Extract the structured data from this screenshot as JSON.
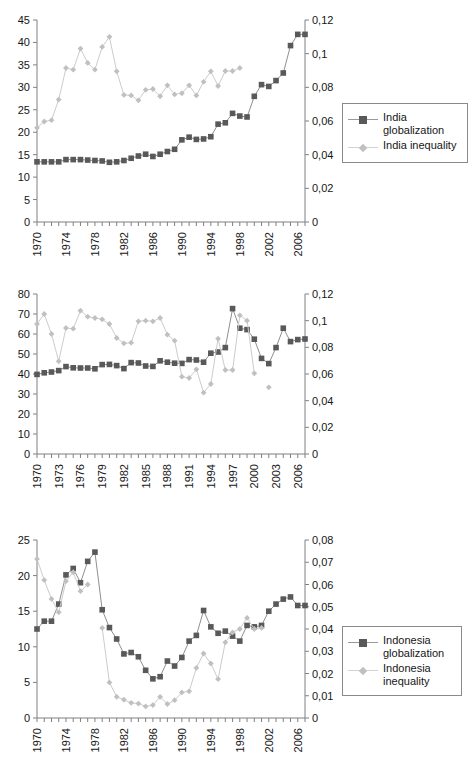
{
  "page": {
    "top_banner_text": "",
    "background": "#ffffff"
  },
  "colors": {
    "globalization_marker": "#595959",
    "globalization_line": "#8f8f8f",
    "inequality_marker": "#c0c0c0",
    "inequality_line": "#cccccc",
    "axis": "#808080",
    "text": "#161616"
  },
  "charts": [
    {
      "id": "india",
      "legend": {
        "items": [
          {
            "label": "India globalization",
            "marker": "square",
            "color": "#595959"
          },
          {
            "label": "India inequality",
            "marker": "diamond",
            "color": "#c0c0c0"
          }
        ]
      }
    },
    {
      "id": "indonesia",
      "legend": {
        "items": [
          {
            "label": "Indonesia\nglobalization",
            "marker": "square",
            "color": "#595959"
          },
          {
            "label": "Indonesia\ninequality",
            "marker": "diamond",
            "color": "#c0c0c0"
          }
        ]
      }
    },
    {
      "id": "iran",
      "legend": {
        "items": [
          {
            "label": "Iran globalization",
            "marker": "square",
            "color": "#595959"
          },
          {
            "label": "Iran inequality",
            "marker": "diamond",
            "color": "#c0c0c0"
          }
        ]
      }
    }
  ],
  "chart_data": [
    {
      "type": "line",
      "id": "india",
      "title": "",
      "xlabel": "",
      "ylabel": "",
      "y2label": "",
      "x": [
        1970,
        1971,
        1972,
        1973,
        1974,
        1975,
        1976,
        1977,
        1978,
        1979,
        1980,
        1981,
        1982,
        1983,
        1984,
        1985,
        1986,
        1987,
        1988,
        1989,
        1990,
        1991,
        1992,
        1993,
        1994,
        1995,
        1996,
        1997,
        1998,
        1999,
        2000,
        2001,
        2002,
        2003,
        2004,
        2005,
        2006,
        2007
      ],
      "xlim": [
        1970,
        2007
      ],
      "xtick_step": 4,
      "xticks": [
        1970,
        1974,
        1978,
        1982,
        1986,
        1990,
        1994,
        1998,
        2002,
        2006
      ],
      "ylim": [
        0,
        45
      ],
      "yticks": [
        0,
        5,
        10,
        15,
        20,
        25,
        30,
        35,
        40,
        45
      ],
      "y2lim": [
        0,
        0.12
      ],
      "y2ticks": [
        "0",
        "0,02",
        "0,04",
        "0,06",
        "0,08",
        "0,1",
        "0,12"
      ],
      "grid": false,
      "legend_position": "right",
      "series": [
        {
          "name": "India globalization",
          "axis": "left",
          "marker": "square",
          "values": [
            13.4,
            13.4,
            13.4,
            13.4,
            13.9,
            13.9,
            13.9,
            13.8,
            13.7,
            13.6,
            13.3,
            13.4,
            13.7,
            14.2,
            14.7,
            15.1,
            14.6,
            15.1,
            15.7,
            16.2,
            18.3,
            18.9,
            18.4,
            18.5,
            19.0,
            21.8,
            22.1,
            24.2,
            23.6,
            23.4,
            28.0,
            30.6,
            30.2,
            31.5,
            33.2,
            39.3,
            41.8,
            41.8
          ]
        },
        {
          "name": "India inequality",
          "axis": "right",
          "marker": "diamond",
          "values": [
            0.056,
            0.0597,
            0.0605,
            0.0727,
            0.0915,
            0.0905,
            0.103,
            0.0945,
            0.0905,
            0.104,
            0.11,
            0.0895,
            0.0755,
            0.0752,
            0.0723,
            0.0785,
            0.079,
            0.0747,
            0.0812,
            0.0758,
            0.0765,
            0.0812,
            0.0752,
            0.0833,
            0.0895,
            0.0808,
            0.0897,
            0.0897,
            0.0915,
            null,
            null,
            null,
            null,
            null,
            null,
            null,
            null,
            null
          ]
        }
      ]
    },
    {
      "type": "line",
      "id": "indonesia",
      "title": "",
      "xlabel": "",
      "ylabel": "",
      "y2label": "",
      "x": [
        1970,
        1971,
        1972,
        1973,
        1974,
        1975,
        1976,
        1977,
        1978,
        1979,
        1980,
        1981,
        1982,
        1983,
        1984,
        1985,
        1986,
        1987,
        1988,
        1989,
        1990,
        1991,
        1992,
        1993,
        1994,
        1995,
        1996,
        1997,
        1998,
        1999,
        2000,
        2001,
        2002,
        2003,
        2004,
        2005,
        2006,
        2007
      ],
      "xlim": [
        1970,
        2007
      ],
      "xtick_step": 3,
      "xticks": [
        1970,
        1973,
        1976,
        1979,
        1982,
        1985,
        1988,
        1991,
        1994,
        1997,
        2000,
        2003,
        2006
      ],
      "ylim": [
        0,
        80
      ],
      "yticks": [
        0,
        10,
        20,
        30,
        40,
        50,
        60,
        70,
        80
      ],
      "y2lim": [
        0,
        0.12
      ],
      "y2ticks": [
        "0",
        "0,02",
        "0,04",
        "0,06",
        "0,08",
        "0,1",
        "0,12"
      ],
      "grid": false,
      "legend_position": "right",
      "series": [
        {
          "name": "Indonesia globalization",
          "axis": "left",
          "marker": "square",
          "values": [
            39.8,
            40.6,
            41.0,
            41.7,
            43.7,
            43.1,
            43.0,
            43.0,
            42.6,
            44.7,
            44.8,
            44.2,
            42.7,
            45.7,
            45.5,
            44.0,
            43.8,
            46.6,
            45.9,
            45.4,
            45.3,
            47.2,
            47.0,
            45.9,
            50.4,
            51.0,
            53.2,
            72.7,
            62.9,
            62.2,
            57.4,
            47.8,
            45.2,
            53.2,
            62.9,
            56.2,
            57.2,
            57.5
          ]
        },
        {
          "name": "Indonesia inequality",
          "axis": "right",
          "marker": "diamond",
          "values": [
            0.0975,
            0.105,
            0.09,
            0.0695,
            0.0945,
            0.094,
            0.1075,
            0.103,
            0.102,
            0.101,
            0.0975,
            0.087,
            0.083,
            0.0835,
            0.0995,
            0.1,
            0.0995,
            0.102,
            0.0895,
            0.085,
            0.058,
            0.057,
            0.0635,
            0.046,
            0.0525,
            0.0865,
            0.063,
            0.063,
            0.104,
            0.1,
            0.0605,
            null,
            0.05,
            null,
            null,
            null,
            null,
            null
          ]
        }
      ]
    },
    {
      "type": "line",
      "id": "iran",
      "title": "",
      "xlabel": "",
      "ylabel": "",
      "y2label": "",
      "x": [
        1970,
        1971,
        1972,
        1973,
        1974,
        1975,
        1976,
        1977,
        1978,
        1979,
        1980,
        1981,
        1982,
        1983,
        1984,
        1985,
        1986,
        1987,
        1988,
        1989,
        1990,
        1991,
        1992,
        1993,
        1994,
        1995,
        1996,
        1997,
        1998,
        1999,
        2000,
        2001,
        2002,
        2003,
        2004,
        2005,
        2006,
        2007
      ],
      "xlim": [
        1970,
        2007
      ],
      "xtick_step": 4,
      "xticks": [
        1970,
        1974,
        1978,
        1982,
        1986,
        1990,
        1994,
        1998,
        2002,
        2006
      ],
      "ylim": [
        0,
        25
      ],
      "yticks": [
        0,
        5,
        10,
        15,
        20,
        25
      ],
      "y2lim": [
        0,
        0.08
      ],
      "y2ticks": [
        "0",
        "0,01",
        "0,02",
        "0,03",
        "0,04",
        "0,05",
        "0,06",
        "0,07",
        "0,08"
      ],
      "grid": false,
      "legend_position": "right",
      "series": [
        {
          "name": "Iran globalization",
          "axis": "left",
          "marker": "square",
          "values": [
            12.5,
            13.6,
            13.6,
            16.0,
            20.1,
            21.0,
            19.0,
            22.0,
            23.3,
            15.2,
            12.7,
            11.1,
            9.0,
            9.2,
            8.6,
            6.7,
            5.5,
            5.8,
            8.0,
            7.3,
            8.5,
            10.8,
            11.6,
            15.1,
            12.8,
            11.9,
            12.2,
            11.5,
            10.8,
            13.0,
            12.8,
            13.0,
            15.0,
            16.0,
            16.7,
            17.0,
            15.8,
            15.8
          ]
        },
        {
          "name": "Iran inequality",
          "axis": "right",
          "marker": "diamond",
          "values": [
            0.0715,
            0.062,
            0.0535,
            0.0475,
            0.0615,
            0.0655,
            0.057,
            0.06,
            null,
            0.0405,
            0.016,
            0.0095,
            0.0082,
            0.0068,
            0.0065,
            0.0052,
            0.0058,
            0.0095,
            0.0063,
            0.008,
            0.0115,
            0.012,
            0.0225,
            0.029,
            0.0245,
            0.0175,
            0.034,
            0.0385,
            0.04,
            0.045,
            0.04,
            0.0405,
            null,
            null,
            null,
            null,
            null,
            null
          ]
        }
      ]
    }
  ]
}
